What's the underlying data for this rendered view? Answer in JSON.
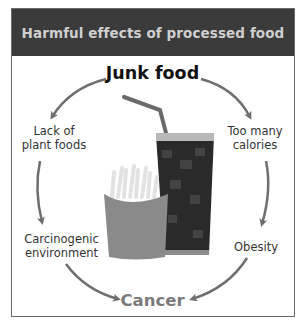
{
  "header": {
    "title": "Harmful effects of processed food"
  },
  "diagram": {
    "center_top": "Junk food",
    "bottom": "Cancer",
    "nodes": [
      {
        "id": "lack",
        "lines": [
          "Lack of",
          "plant foods"
        ]
      },
      {
        "id": "calories",
        "lines": [
          "Too many",
          "calories"
        ]
      },
      {
        "id": "carcinogenic",
        "lines": [
          "Carcinogenic",
          "environment"
        ]
      },
      {
        "id": "obesity",
        "lines": [
          "Obesity"
        ]
      }
    ],
    "illustration": {
      "description": "french-fries-and-soda"
    }
  },
  "colors": {
    "header_bg": "#3b3b3b",
    "header_text": "#cfcfcf",
    "arrow": "#6e6e6e",
    "cancer_text": "#7a7a7a"
  }
}
